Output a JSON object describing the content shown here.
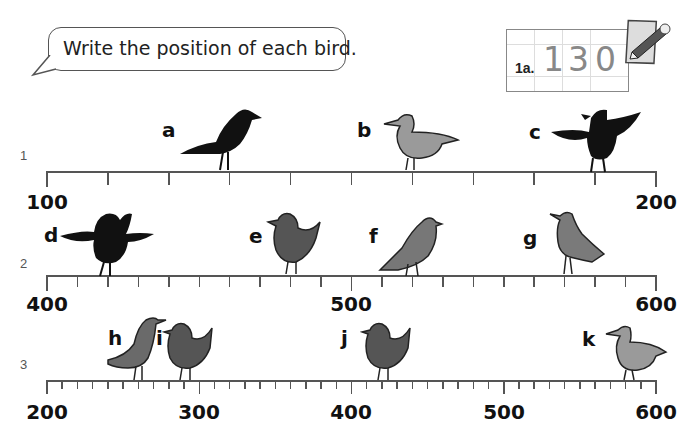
{
  "instruction": "Write the position of each bird.",
  "example": {
    "label": "1a.",
    "answer_digits": [
      "1",
      "3",
      "0"
    ],
    "icon": "pencil-paper-icon"
  },
  "number_lines": [
    {
      "row_label": "1",
      "start": 100,
      "end": 200,
      "major_step": 10,
      "minor_step": null,
      "labels": [
        {
          "value": "100",
          "x": 47
        },
        {
          "value": "200",
          "x": 656
        }
      ],
      "birds": [
        {
          "letter": "a",
          "position": 130,
          "color": "#111111",
          "type": "crow"
        },
        {
          "letter": "b",
          "position": 160,
          "color": "#9a9a9a",
          "type": "pigeon"
        },
        {
          "letter": "c",
          "position": 190,
          "color": "#111111",
          "type": "crow-wings-open"
        }
      ]
    },
    {
      "row_label": "2",
      "start": 400,
      "end": 600,
      "major_step": 10,
      "minor_step": null,
      "labels": [
        {
          "value": "400",
          "x": 47
        },
        {
          "value": "500",
          "x": 351
        },
        {
          "value": "600",
          "x": 656
        }
      ],
      "birds": [
        {
          "letter": "d",
          "position": 420,
          "color": "#111111",
          "type": "crow-wings-open"
        },
        {
          "letter": "e",
          "position": 480,
          "color": "#555555",
          "type": "robin"
        },
        {
          "letter": "f",
          "position": 520,
          "color": "#777777",
          "type": "pigeon"
        },
        {
          "letter": "g",
          "position": 570,
          "color": "#7a7a7a",
          "type": "thrush"
        }
      ]
    },
    {
      "row_label": "3",
      "start": 200,
      "end": 600,
      "major_step": 100,
      "minor_step": 10,
      "labels": [
        {
          "value": "200",
          "x": 47
        },
        {
          "value": "300",
          "x": 199
        },
        {
          "value": "400",
          "x": 351
        },
        {
          "value": "500",
          "x": 504
        },
        {
          "value": "600",
          "x": 656
        }
      ],
      "birds": [
        {
          "letter": "h",
          "position": 260,
          "color": "#6a6a6a",
          "type": "blackbird"
        },
        {
          "letter": "i",
          "position": 290,
          "color": "#555555",
          "type": "robin"
        },
        {
          "letter": "j",
          "position": 420,
          "color": "#555555",
          "type": "robin"
        },
        {
          "letter": "k",
          "position": 580,
          "color": "#9a9a9a",
          "type": "pigeon"
        }
      ]
    }
  ]
}
